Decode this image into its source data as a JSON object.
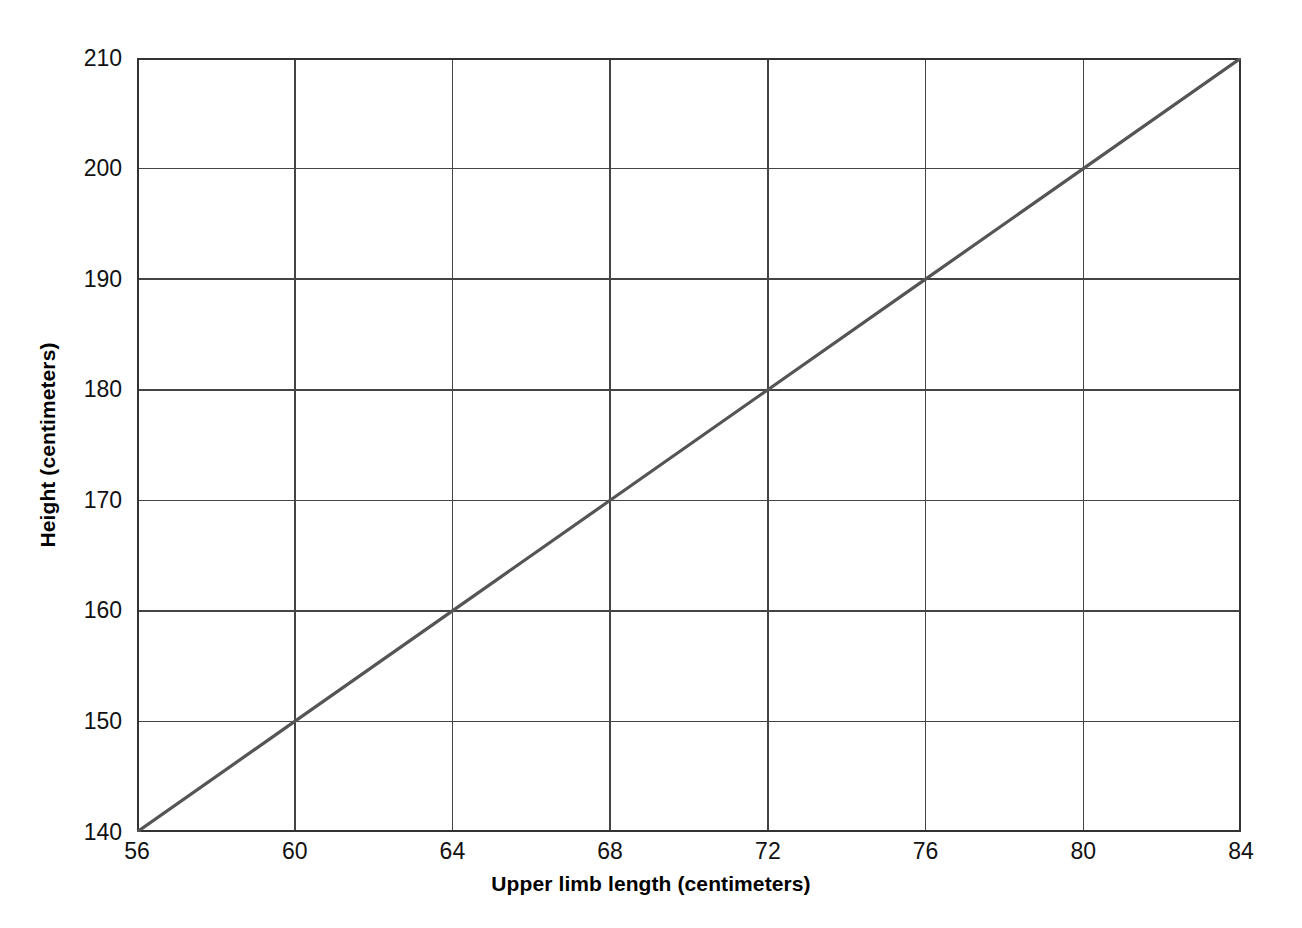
{
  "chart_data": {
    "type": "line",
    "title": "",
    "xlabel": "Upper limb length (centimeters)",
    "ylabel": "Height (centimeters)",
    "xlim": [
      56,
      84
    ],
    "ylim": [
      140,
      210
    ],
    "xticks": [
      56,
      60,
      64,
      68,
      72,
      76,
      80,
      84
    ],
    "yticks": [
      140,
      150,
      160,
      170,
      180,
      190,
      200,
      210
    ],
    "xtick_labels": [
      "56",
      "60",
      "64",
      "68",
      "72",
      "76",
      "80",
      "84"
    ],
    "ytick_labels": [
      "140",
      "150",
      "160",
      "170",
      "180",
      "190",
      "200",
      "210"
    ],
    "grid": true,
    "legend": null,
    "series": [
      {
        "name": "Height vs upper limb length",
        "x": [
          56,
          60,
          64,
          68,
          72,
          76,
          80,
          84
        ],
        "values": [
          140,
          150,
          160,
          170,
          180,
          190,
          200,
          210
        ],
        "color": "#555555"
      }
    ]
  },
  "style": {
    "background": "#ffffff",
    "axis_color": "#333333",
    "grid_color": "#444444",
    "line_color": "#555555",
    "text_color": "#111111"
  }
}
